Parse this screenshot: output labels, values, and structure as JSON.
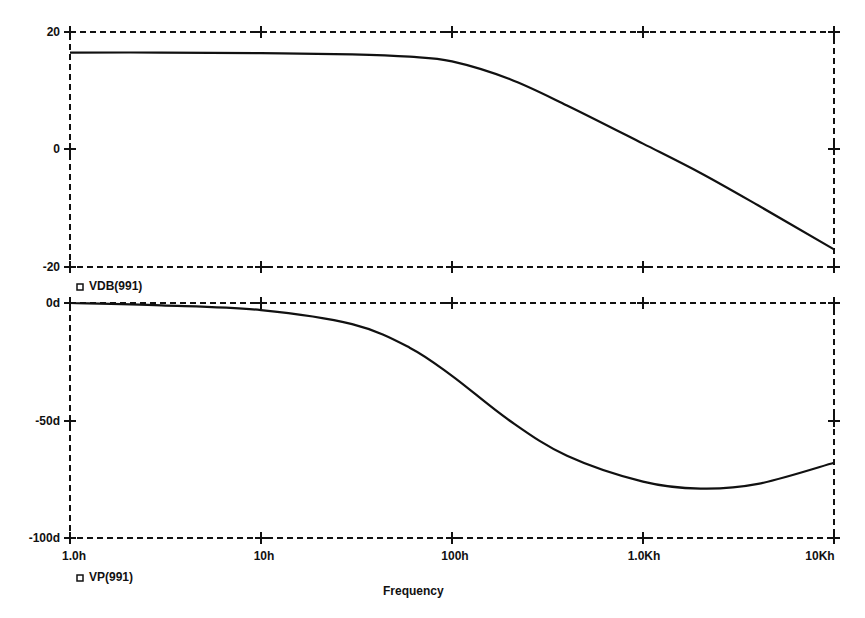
{
  "chart_data": [
    {
      "type": "line",
      "title": "",
      "xlabel": "Frequency",
      "ylabel": "",
      "xscale": "log",
      "xlim": [
        1,
        10000
      ],
      "ylim": [
        -20,
        20
      ],
      "yticks": [
        "20",
        "0",
        "-20"
      ],
      "grid": false,
      "legend": "VDB(991)",
      "series": [
        {
          "name": "VDB(991)",
          "x": [
            1,
            3,
            10,
            30,
            60,
            100,
            200,
            400,
            1000,
            2000,
            4000,
            10000
          ],
          "values": [
            16.5,
            16.5,
            16.4,
            16.2,
            15.8,
            15.0,
            12.0,
            7.5,
            1.0,
            -4.0,
            -9.5,
            -17.0
          ]
        }
      ]
    },
    {
      "type": "line",
      "title": "",
      "xlabel": "Frequency",
      "ylabel": "",
      "xscale": "log",
      "xlim": [
        1,
        10000
      ],
      "ylim": [
        -100,
        0
      ],
      "yticks": [
        "0d",
        "-50d",
        "-100d"
      ],
      "xticks": [
        "1.0h",
        "10h",
        "100h",
        "1.0Kh",
        "10Kh"
      ],
      "grid": false,
      "legend": "VP(991)",
      "series": [
        {
          "name": "VP(991)",
          "x": [
            1,
            3,
            10,
            30,
            60,
            100,
            200,
            400,
            1000,
            2000,
            4000,
            10000
          ],
          "values": [
            0,
            -1,
            -3,
            -9,
            -19,
            -31,
            -50,
            -65,
            -76,
            -79,
            -77,
            -68
          ]
        }
      ]
    }
  ],
  "top_plot": {
    "y_ticks": [
      "20",
      "0",
      "-20"
    ],
    "legend_label": "VDB(991)"
  },
  "bottom_plot": {
    "y_ticks": [
      "0d",
      "-50d",
      "-100d"
    ],
    "x_ticks": [
      "1.0h",
      "10h",
      "100h",
      "1.0Kh",
      "10Kh"
    ],
    "legend_label": "VP(991)"
  },
  "x_axis_title": "Frequency",
  "legend_marker": "square-marker-icon"
}
